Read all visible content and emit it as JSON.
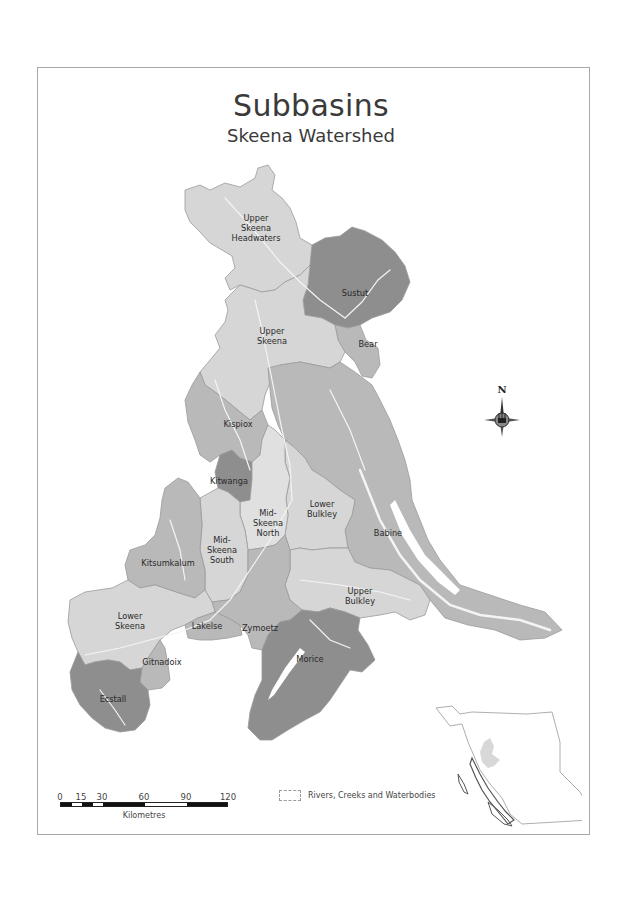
{
  "title": "Subbasins",
  "subtitle": "Skeena Watershed",
  "colors": {
    "light": "#d6d6d6",
    "medium": "#b9b9b9",
    "dark": "#8e8e8e",
    "rivers": "#f2f2f2",
    "frame": "#a8a8a8"
  },
  "subbasins": [
    {
      "name": "Upper Skeena Headwaters",
      "lines": [
        "Upper",
        "Skeena",
        "Headwaters"
      ],
      "shade": "light"
    },
    {
      "name": "Sustut",
      "lines": [
        "Sustut"
      ],
      "shade": "dark"
    },
    {
      "name": "Bear",
      "lines": [
        "Bear"
      ],
      "shade": "medium"
    },
    {
      "name": "Upper Skeena",
      "lines": [
        "Upper",
        "Skeena"
      ],
      "shade": "light"
    },
    {
      "name": "Kispiox",
      "lines": [
        "Kispiox"
      ],
      "shade": "medium"
    },
    {
      "name": "Kitwanga",
      "lines": [
        "Kitwanga"
      ],
      "shade": "dark"
    },
    {
      "name": "Mid-Skeena North",
      "lines": [
        "Mid-",
        "Skeena",
        "North"
      ],
      "shade": "light"
    },
    {
      "name": "Lower Bulkley",
      "lines": [
        "Lower",
        "Bulkley"
      ],
      "shade": "light"
    },
    {
      "name": "Babine",
      "lines": [
        "Babine"
      ],
      "shade": "medium"
    },
    {
      "name": "Mid-Skeena South",
      "lines": [
        "Mid-",
        "Skeena",
        "South"
      ],
      "shade": "light"
    },
    {
      "name": "Kitsumkalum",
      "lines": [
        "Kitsumkalum"
      ],
      "shade": "medium"
    },
    {
      "name": "Upper Bulkley",
      "lines": [
        "Upper",
        "Bulkley"
      ],
      "shade": "light"
    },
    {
      "name": "Lower Skeena",
      "lines": [
        "Lower",
        "Skeena"
      ],
      "shade": "light"
    },
    {
      "name": "Lakelse",
      "lines": [
        "Lakelse"
      ],
      "shade": "medium"
    },
    {
      "name": "Zymoetz",
      "lines": [
        "Zymoetz"
      ],
      "shade": "medium"
    },
    {
      "name": "Morice",
      "lines": [
        "Morice"
      ],
      "shade": "dark"
    },
    {
      "name": "Gitnadoix",
      "lines": [
        "Gitnadoix"
      ],
      "shade": "medium"
    },
    {
      "name": "Ecstall",
      "lines": [
        "Ecstall"
      ],
      "shade": "dark"
    }
  ],
  "compass": {
    "label": "N"
  },
  "scale": {
    "ticks": [
      "0",
      "15",
      "30",
      "60",
      "90",
      "120"
    ],
    "unit": "Kilometres"
  },
  "legend": {
    "items": [
      {
        "label": "Rivers, Creeks and Waterbodies",
        "icon": "dashed-outline-swatch"
      }
    ]
  },
  "inset": {
    "label": "British Columbia locator",
    "icon": "bc-outline-map"
  }
}
